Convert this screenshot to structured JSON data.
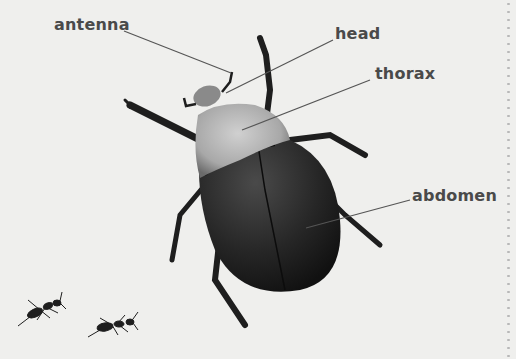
{
  "diagram": {
    "labels": {
      "antenna": "antenna",
      "head": "head",
      "thorax": "thorax",
      "abdomen": "abdomen"
    },
    "extras": [
      "ants"
    ]
  },
  "colors": {
    "background": "#efefed",
    "label_text": "#4a4a4a",
    "leader_line": "#555555",
    "beetle_dark": "#1e1e1e",
    "thorax_light": "#b5b5b5"
  }
}
